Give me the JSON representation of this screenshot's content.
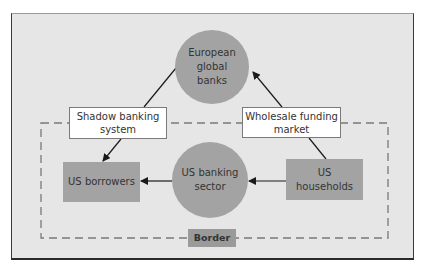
{
  "diagram": {
    "nodes": {
      "european_banks": {
        "label": "European\nglobal\nbanks",
        "shape": "circle",
        "fill": "#a3a3a3"
      },
      "us_banking": {
        "label": "US banking\nsector",
        "shape": "circle",
        "fill": "#a3a3a3"
      },
      "us_borrowers": {
        "label": "US borrowers",
        "shape": "rect",
        "fill": "#a3a3a3"
      },
      "us_households": {
        "label": "US\nhouseholds",
        "shape": "rect",
        "fill": "#a3a3a3"
      },
      "shadow_banking": {
        "label": "Shadow banking\nsystem",
        "shape": "rect",
        "fill": "#ffffff"
      },
      "wholesale_funding": {
        "label": "Wholesale funding\nmarket",
        "shape": "rect",
        "fill": "#ffffff"
      },
      "border": {
        "label": "Border",
        "shape": "rect",
        "fill": "#9a9a9a"
      }
    },
    "edges": [
      {
        "from": "european_banks",
        "to": "shadow_banking",
        "arrow": "none"
      },
      {
        "from": "shadow_banking",
        "to": "us_borrowers",
        "arrow": "end"
      },
      {
        "from": "wholesale_funding",
        "to": "european_banks",
        "arrow": "end"
      },
      {
        "from": "us_households",
        "to": "wholesale_funding",
        "arrow": "none"
      },
      {
        "from": "us_banking",
        "to": "us_borrowers",
        "arrow": "end"
      },
      {
        "from": "us_households",
        "to": "us_banking",
        "arrow": "end"
      }
    ],
    "region": {
      "name": "US border",
      "style": "dashed",
      "color": "#7a7a7a"
    },
    "colors": {
      "background": "#e6e6e6",
      "line": "#1a1a1a",
      "text": "#333333"
    }
  }
}
